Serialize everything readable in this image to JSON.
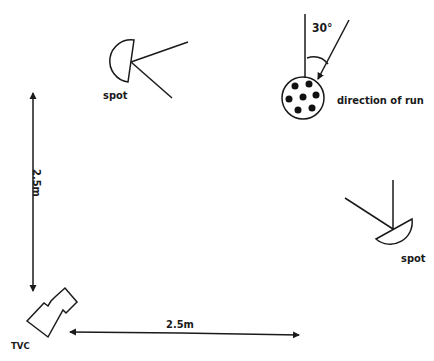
{
  "diagram": {
    "title": "",
    "labels": {
      "spot_top": "spot",
      "spot_right": "spot",
      "angle": "30°",
      "direction": "direction of run",
      "vertical_distance": "2.5m",
      "horizontal_distance": "2.5m",
      "camera": "TVC"
    },
    "elements": [
      {
        "id": "spot-top",
        "type": "spotlight",
        "label": "spot"
      },
      {
        "id": "spot-right",
        "type": "spotlight",
        "label": "spot"
      },
      {
        "id": "subject",
        "type": "circle-with-dots",
        "dot_count": 7,
        "label": "direction of run"
      },
      {
        "id": "camera",
        "type": "camera",
        "label": "TVC"
      }
    ],
    "measurements": [
      {
        "axis": "vertical",
        "value": "2.5m"
      },
      {
        "axis": "horizontal",
        "value": "2.5m"
      },
      {
        "type": "angle",
        "value": "30°"
      }
    ],
    "colors": {
      "ink": "#1a1a1a",
      "background": "#ffffff"
    }
  }
}
